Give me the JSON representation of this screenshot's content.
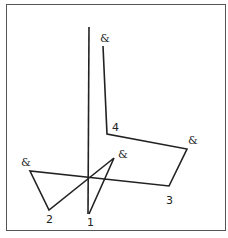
{
  "diagram": {
    "frame": {
      "x": 6,
      "y": 4,
      "width": 220,
      "height": 227,
      "color": "#555555"
    },
    "stroke_color": "#222222",
    "polylines": [
      {
        "name": "vertical-axis-line",
        "points": [
          [
            89,
            27
          ],
          [
            88,
            214
          ]
        ]
      },
      {
        "name": "main-path",
        "points": [
          [
            103,
            46
          ],
          [
            107,
            134
          ],
          [
            187,
            149
          ],
          [
            169,
            186
          ],
          [
            30,
            171
          ],
          [
            49,
            210
          ],
          [
            114,
            158
          ],
          [
            89,
            214
          ]
        ]
      }
    ],
    "labels": [
      {
        "name": "label-amp-top",
        "text": "&",
        "x": 100,
        "y": 42,
        "class": "lbl"
      },
      {
        "name": "label-4",
        "text": "4",
        "x": 112,
        "y": 131,
        "class": "num"
      },
      {
        "name": "label-amp-right",
        "text": "&",
        "x": 188,
        "y": 144,
        "class": "lbl"
      },
      {
        "name": "label-3",
        "text": "3",
        "x": 166,
        "y": 204,
        "class": "num"
      },
      {
        "name": "label-amp-left",
        "text": "&",
        "x": 21,
        "y": 166,
        "class": "lbl"
      },
      {
        "name": "label-2",
        "text": "2",
        "x": 46,
        "y": 223,
        "class": "num"
      },
      {
        "name": "label-amp-middle",
        "text": "&",
        "x": 118,
        "y": 158,
        "class": "lbl"
      },
      {
        "name": "label-1",
        "text": "1",
        "x": 87,
        "y": 226,
        "class": "num"
      }
    ]
  }
}
